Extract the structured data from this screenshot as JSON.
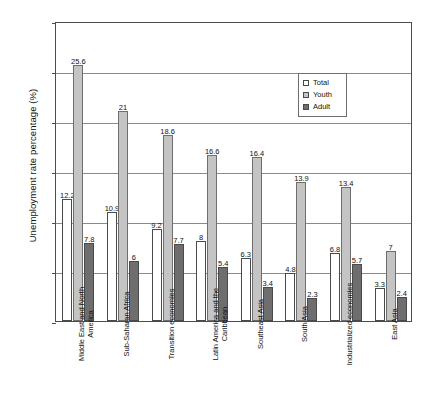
{
  "chart_data": {
    "type": "bar",
    "title": "",
    "xlabel": "",
    "ylabel": "Unemployment rate percentage (%)",
    "ylim": [
      0,
      30
    ],
    "yticks": [
      "0",
      "5",
      "10",
      "15",
      "20",
      "25",
      "30"
    ],
    "grid": true,
    "legend_position": "top-center-right",
    "categories": [
      "Middle East and North America",
      "Sub-Saharan Africa",
      "Transition economies",
      "Latin America and the Caribbean",
      "Southeast Asia",
      "South Asia",
      "Industrialized economies",
      "East Asia"
    ],
    "series": [
      {
        "name": "Total",
        "color": "#ffffff",
        "values": [
          12.2,
          10.9,
          9.2,
          8,
          6.3,
          4.8,
          6.8,
          3.3
        ],
        "labels": [
          "12.2",
          "10.9",
          "9.2",
          "8",
          "6.3",
          "4.8",
          "6.8",
          "3.3"
        ]
      },
      {
        "name": "Youth",
        "color": "#c4c4c4",
        "values": [
          25.6,
          21,
          18.6,
          16.6,
          16.4,
          13.9,
          13.4,
          7
        ],
        "labels": [
          "25.6",
          "21",
          "18.6",
          "16.6",
          "16.4",
          "13.9",
          "13.4",
          "7"
        ]
      },
      {
        "name": "Adult",
        "color": "#6e6e6e",
        "values": [
          7.8,
          6,
          7.7,
          5.4,
          3.4,
          2.3,
          5.7,
          2.4
        ],
        "labels": [
          "7.8",
          "6",
          "7.7",
          "5.4",
          "3.4",
          "2.3",
          "5.7",
          "2.4"
        ]
      }
    ]
  },
  "legend": {
    "items": [
      {
        "label": "Total"
      },
      {
        "label": "Youth"
      },
      {
        "label": "Adult"
      }
    ]
  }
}
